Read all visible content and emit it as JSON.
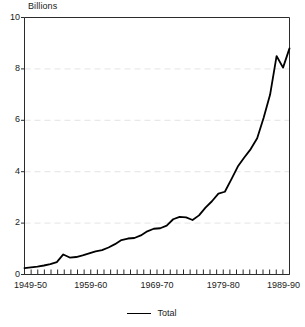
{
  "chart_data": {
    "type": "line",
    "title": "",
    "unit_label": "Billions",
    "xlabel": "",
    "ylabel": "",
    "ylim": [
      0,
      10
    ],
    "yticks": [
      0,
      2,
      4,
      6,
      8,
      10
    ],
    "ytick_labels": [
      "0",
      "2",
      "4",
      "6",
      "8",
      "10"
    ],
    "grid": "horizontal-dashed-faint",
    "legend_position": "bottom-center",
    "xtick_labels": [
      "1949-50",
      "1959-60",
      "1969-70",
      "1979-80",
      "1989-90"
    ],
    "xtick_label_positions": [
      0,
      10,
      20,
      30,
      40
    ],
    "minor_tick_count": 41,
    "categories": [
      "1949-50",
      "1950-51",
      "1951-52",
      "1952-53",
      "1953-54",
      "1954-55",
      "1955-56",
      "1956-57",
      "1957-58",
      "1958-59",
      "1959-60",
      "1960-61",
      "1961-62",
      "1962-63",
      "1963-64",
      "1964-65",
      "1965-66",
      "1966-67",
      "1967-68",
      "1968-69",
      "1969-70",
      "1970-71",
      "1971-72",
      "1972-73",
      "1973-74",
      "1974-75",
      "1975-76",
      "1976-77",
      "1977-78",
      "1978-79",
      "1979-80",
      "1980-81",
      "1981-82",
      "1982-83",
      "1983-84",
      "1984-85",
      "1985-86",
      "1986-87",
      "1987-88",
      "1988-89",
      "1989-90"
    ],
    "series": [
      {
        "name": "Total",
        "color": "#000000",
        "values": [
          0.25,
          0.28,
          0.31,
          0.35,
          0.4,
          0.48,
          0.78,
          0.66,
          0.68,
          0.74,
          0.82,
          0.9,
          0.95,
          1.05,
          1.18,
          1.34,
          1.4,
          1.42,
          1.52,
          1.68,
          1.78,
          1.8,
          1.9,
          2.15,
          2.24,
          2.22,
          2.12,
          2.3,
          2.6,
          2.85,
          3.15,
          3.22,
          3.7,
          4.2,
          4.55,
          4.88,
          5.3,
          6.1,
          7.0,
          8.5,
          8.05
        ]
      }
    ],
    "final_value": 8.8,
    "annotations": []
  },
  "legend": {
    "entries": [
      {
        "label": "Total"
      }
    ]
  }
}
